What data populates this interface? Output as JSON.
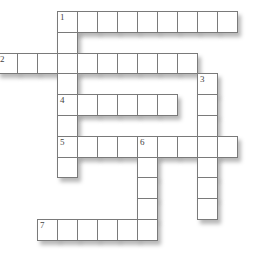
{
  "puzzle": {
    "type": "crossword",
    "grid_origin": {
      "x": 57,
      "y": 11
    },
    "cell_width": 20,
    "cell_height": 20.8,
    "entries": [
      {
        "number": "1",
        "direction": "across",
        "row": 0,
        "col": 0,
        "length": 9
      },
      {
        "number": "1",
        "direction": "down",
        "row": 0,
        "col": 0,
        "length": 8
      },
      {
        "number": "2",
        "direction": "across",
        "row": 2,
        "col": -3,
        "length": 10
      },
      {
        "number": "3",
        "direction": "down",
        "row": 3,
        "col": 7,
        "length": 7
      },
      {
        "number": "4",
        "direction": "across",
        "row": 4,
        "col": 0,
        "length": 6
      },
      {
        "number": "5",
        "direction": "across",
        "row": 6,
        "col": 0,
        "length": 9
      },
      {
        "number": "6",
        "direction": "down",
        "row": 6,
        "col": 4,
        "length": 5
      },
      {
        "number": "7",
        "direction": "across",
        "row": 10,
        "col": -1,
        "length": 6
      }
    ],
    "numbered_cells": [
      {
        "label": "1",
        "row": 0,
        "col": 0
      },
      {
        "label": "2",
        "row": 2,
        "col": -3
      },
      {
        "label": "3",
        "row": 3,
        "col": 7
      },
      {
        "label": "4",
        "row": 4,
        "col": 0
      },
      {
        "label": "5",
        "row": 6,
        "col": 0
      },
      {
        "label": "6",
        "row": 6,
        "col": 4
      },
      {
        "label": "7",
        "row": 10,
        "col": -1
      }
    ]
  }
}
